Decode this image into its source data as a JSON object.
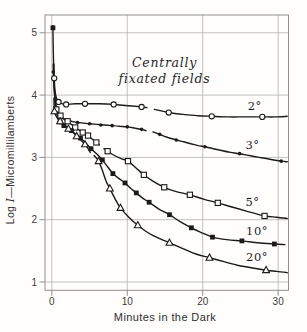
{
  "figure": {
    "kind": "scientific-line-chart",
    "background": "#fffefd"
  },
  "chart_data": {
    "type": "line",
    "title": "",
    "annotation": {
      "lines": [
        "Centrally",
        "fixated fields"
      ]
    },
    "x_axis": {
      "title": "Minutes in the Dark",
      "range": [
        -0.9,
        31.3
      ],
      "ticks": [
        {
          "value": 0,
          "label": "0"
        },
        {
          "value": 10,
          "label": "10"
        },
        {
          "value": 20,
          "label": "20"
        },
        {
          "value": 30,
          "label": "30"
        }
      ]
    },
    "y_axis": {
      "title_prefix": "Log ",
      "title_var": "I",
      "title_suffix": "—Micromillilamberts",
      "range": [
        0.87,
        5.29
      ],
      "ticks": [
        {
          "value": 5,
          "label": "5"
        },
        {
          "value": 4,
          "label": "4"
        },
        {
          "value": 3,
          "label": "3"
        },
        {
          "value": 2,
          "label": "2"
        },
        {
          "value": 1,
          "label": "1"
        }
      ]
    },
    "grid": true,
    "legend_position": "labels-on-curves",
    "colors": {
      "ink": "#1b1b1b",
      "grid": "#acacac",
      "frame": "#8f8f8f",
      "tick_text": "#3c3c3c",
      "background": "#ffffff"
    },
    "series": [
      {
        "name": "2°",
        "field_size_deg": 2,
        "marker": "open-circle",
        "label_pos": [
          26.9,
          3.83
        ],
        "points": [
          [
            0.32,
            4.27
          ],
          [
            0.9,
            3.89
          ],
          [
            1.9,
            3.85
          ],
          [
            4.4,
            3.86
          ],
          [
            8.2,
            3.85
          ],
          [
            11.9,
            3.81
          ],
          [
            15.5,
            3.72
          ],
          [
            21.2,
            3.66
          ],
          [
            27.9,
            3.65
          ]
        ],
        "line_segments": [
          [
            [
              0.28,
              4.5
            ],
            [
              0.32,
              4.27
            ],
            [
              0.45,
              4.05
            ],
            [
              0.62,
              3.95
            ],
            [
              0.9,
              3.89
            ],
            [
              1.4,
              3.86
            ],
            [
              1.9,
              3.85
            ],
            [
              3.1,
              3.86
            ],
            [
              4.4,
              3.86
            ],
            [
              6.3,
              3.86
            ],
            [
              8.2,
              3.85
            ],
            [
              10.1,
              3.83
            ],
            [
              11.9,
              3.81
            ],
            [
              12.6,
              3.8
            ]
          ],
          [
            [
              13.6,
              3.77
            ],
            [
              15.5,
              3.72
            ],
            [
              17.4,
              3.69
            ],
            [
              19.4,
              3.67
            ],
            [
              21.2,
              3.66
            ],
            [
              23.4,
              3.65
            ],
            [
              25.5,
              3.65
            ],
            [
              27.9,
              3.65
            ],
            [
              29.6,
              3.65
            ],
            [
              31.2,
              3.66
            ]
          ]
        ]
      },
      {
        "name": "3°",
        "field_size_deg": 3,
        "marker": "small-filled-circle",
        "label_pos": [
          26.6,
          3.2
        ],
        "points": [
          [
            0.2,
            4.37
          ],
          [
            0.65,
            3.79
          ],
          [
            1.3,
            3.64
          ],
          [
            1.9,
            3.6
          ],
          [
            3.4,
            3.56
          ],
          [
            5.0,
            3.54
          ],
          [
            6.5,
            3.52
          ],
          [
            8.0,
            3.51
          ],
          [
            10.0,
            3.49
          ],
          [
            11.9,
            3.45
          ],
          [
            14.3,
            3.37
          ],
          [
            16.5,
            3.28
          ],
          [
            20.3,
            3.17
          ],
          [
            24.9,
            3.06
          ],
          [
            30.4,
            2.94
          ]
        ],
        "line_segments": [
          [
            [
              0.18,
              4.5
            ],
            [
              0.2,
              4.37
            ],
            [
              0.3,
              4.1
            ],
            [
              0.45,
              3.92
            ],
            [
              0.65,
              3.79
            ],
            [
              0.95,
              3.7
            ],
            [
              1.3,
              3.64
            ],
            [
              1.9,
              3.6
            ],
            [
              2.6,
              3.58
            ],
            [
              3.4,
              3.56
            ],
            [
              4.2,
              3.55
            ],
            [
              5.0,
              3.54
            ],
            [
              6.0,
              3.53
            ],
            [
              7.0,
              3.52
            ],
            [
              8.0,
              3.51
            ],
            [
              9.0,
              3.5
            ],
            [
              10.0,
              3.49
            ],
            [
              11.0,
              3.47
            ],
            [
              11.9,
              3.45
            ],
            [
              12.5,
              3.43
            ]
          ],
          [
            [
              13.4,
              3.41
            ],
            [
              14.3,
              3.37
            ],
            [
              15.4,
              3.32
            ],
            [
              16.5,
              3.28
            ],
            [
              17.5,
              3.25
            ],
            [
              18.4,
              3.22
            ],
            [
              19.4,
              3.19
            ],
            [
              20.3,
              3.17
            ],
            [
              21.4,
              3.14
            ],
            [
              22.5,
              3.11
            ],
            [
              23.7,
              3.08
            ],
            [
              24.9,
              3.06
            ],
            [
              26.2,
              3.03
            ],
            [
              27.5,
              3.0
            ],
            [
              28.9,
              2.97
            ],
            [
              30.4,
              2.94
            ],
            [
              31.2,
              2.93
            ]
          ]
        ]
      },
      {
        "name": "5°",
        "field_size_deg": 5,
        "marker": "open-square",
        "label_pos": [
          26.6,
          2.28
        ],
        "points": [
          [
            0.6,
            3.77
          ],
          [
            1.15,
            3.67
          ],
          [
            2.1,
            3.58
          ],
          [
            3.1,
            3.48
          ],
          [
            4.1,
            3.4
          ],
          [
            4.8,
            3.35
          ],
          [
            5.9,
            3.24
          ],
          [
            7.4,
            3.1
          ],
          [
            10.1,
            2.94
          ],
          [
            12.2,
            2.72
          ],
          [
            14.9,
            2.52
          ],
          [
            18.3,
            2.4
          ],
          [
            22.0,
            2.27
          ],
          [
            28.2,
            2.06
          ]
        ],
        "line_segments": [
          [
            [
              0.38,
              4.0
            ],
            [
              0.45,
              3.86
            ],
            [
              0.6,
              3.77
            ],
            [
              0.85,
              3.71
            ],
            [
              1.15,
              3.67
            ],
            [
              1.5,
              3.63
            ],
            [
              2.1,
              3.58
            ],
            [
              2.6,
              3.53
            ],
            [
              3.1,
              3.48
            ],
            [
              3.6,
              3.44
            ],
            [
              4.1,
              3.4
            ],
            [
              4.8,
              3.35
            ],
            [
              5.3,
              3.3
            ],
            [
              5.9,
              3.24
            ],
            [
              6.3,
              3.2
            ]
          ],
          [
            [
              6.9,
              3.14
            ],
            [
              7.4,
              3.1
            ],
            [
              8.3,
              3.03
            ],
            [
              9.2,
              2.98
            ],
            [
              10.1,
              2.94
            ],
            [
              11.1,
              2.84
            ],
            [
              12.2,
              2.72
            ],
            [
              13.5,
              2.61
            ],
            [
              14.9,
              2.52
            ],
            [
              16.5,
              2.45
            ],
            [
              18.3,
              2.4
            ],
            [
              20.1,
              2.33
            ],
            [
              22.0,
              2.27
            ],
            [
              24.0,
              2.2
            ],
            [
              26.0,
              2.13
            ],
            [
              28.2,
              2.06
            ],
            [
              29.8,
              2.04
            ],
            [
              31.2,
              2.02
            ]
          ]
        ]
      },
      {
        "name": "10°",
        "field_size_deg": 10,
        "marker": "filled-square",
        "label_pos": [
          27.2,
          1.82
        ],
        "points": [
          [
            0.15,
            5.08
          ],
          [
            1.1,
            3.57
          ],
          [
            1.6,
            3.51
          ],
          [
            2.6,
            3.43
          ],
          [
            3.8,
            3.31
          ],
          [
            5.2,
            3.14
          ],
          [
            6.7,
            2.96
          ],
          [
            8.1,
            2.74
          ],
          [
            9.7,
            2.59
          ],
          [
            11.2,
            2.43
          ],
          [
            12.9,
            2.28
          ],
          [
            15.6,
            2.08
          ],
          [
            18.5,
            1.87
          ],
          [
            21.3,
            1.72
          ],
          [
            25.2,
            1.66
          ],
          [
            29.5,
            1.61
          ]
        ],
        "line_segments": [
          [
            [
              0.12,
              5.1
            ],
            [
              0.15,
              5.08
            ],
            [
              0.2,
              4.7
            ],
            [
              0.28,
              4.3
            ],
            [
              0.38,
              4.0
            ],
            [
              0.55,
              3.78
            ],
            [
              0.8,
              3.64
            ],
            [
              1.1,
              3.57
            ],
            [
              1.6,
              3.51
            ],
            [
              2.1,
              3.47
            ],
            [
              2.6,
              3.43
            ],
            [
              3.2,
              3.37
            ],
            [
              3.8,
              3.31
            ],
            [
              4.5,
              3.23
            ],
            [
              5.2,
              3.14
            ],
            [
              6.0,
              3.05
            ],
            [
              6.7,
              2.96
            ],
            [
              7.4,
              2.85
            ],
            [
              8.1,
              2.74
            ],
            [
              8.9,
              2.66
            ],
            [
              9.7,
              2.59
            ],
            [
              10.4,
              2.51
            ],
            [
              11.2,
              2.43
            ],
            [
              12.0,
              2.35
            ],
            [
              12.9,
              2.28
            ],
            [
              14.2,
              2.17
            ],
            [
              15.6,
              2.08
            ],
            [
              17.0,
              1.97
            ],
            [
              18.5,
              1.87
            ],
            [
              19.9,
              1.79
            ],
            [
              21.3,
              1.72
            ],
            [
              23.2,
              1.68
            ],
            [
              25.2,
              1.66
            ],
            [
              27.3,
              1.63
            ],
            [
              29.5,
              1.61
            ],
            [
              30.9,
              1.6
            ]
          ]
        ]
      },
      {
        "name": "20°",
        "field_size_deg": 20,
        "marker": "open-triangle",
        "label_pos": [
          27.2,
          1.4
        ],
        "points": [
          [
            0.35,
            3.74
          ],
          [
            1.1,
            3.58
          ],
          [
            2.2,
            3.46
          ],
          [
            3.3,
            3.34
          ],
          [
            4.4,
            3.21
          ],
          [
            6.2,
            2.94
          ],
          [
            7.7,
            2.5
          ],
          [
            9.1,
            2.19
          ],
          [
            11.4,
            1.91
          ],
          [
            15.6,
            1.63
          ],
          [
            20.9,
            1.39
          ],
          [
            28.4,
            1.19
          ]
        ],
        "line_segments": [
          [
            [
              0.28,
              3.95
            ],
            [
              0.35,
              3.74
            ],
            [
              0.55,
              3.67
            ],
            [
              0.8,
              3.62
            ],
            [
              1.1,
              3.58
            ],
            [
              1.6,
              3.53
            ],
            [
              2.2,
              3.46
            ],
            [
              2.8,
              3.4
            ],
            [
              3.3,
              3.34
            ],
            [
              3.9,
              3.27
            ],
            [
              4.4,
              3.21
            ],
            [
              4.8,
              3.14
            ],
            [
              5.1,
              3.08
            ]
          ],
          [
            [
              5.6,
              3.03
            ],
            [
              6.2,
              2.94
            ],
            [
              6.7,
              2.79
            ],
            [
              7.2,
              2.62
            ],
            [
              7.7,
              2.5
            ],
            [
              8.4,
              2.33
            ],
            [
              9.1,
              2.19
            ],
            [
              10.2,
              2.04
            ],
            [
              11.4,
              1.91
            ],
            [
              12.5,
              1.81
            ],
            [
              13.5,
              1.74
            ],
            [
              14.6,
              1.68
            ],
            [
              15.6,
              1.63
            ],
            [
              17.3,
              1.54
            ],
            [
              19.1,
              1.45
            ],
            [
              20.9,
              1.39
            ],
            [
              22.7,
              1.33
            ],
            [
              24.6,
              1.27
            ],
            [
              26.4,
              1.23
            ],
            [
              28.4,
              1.19
            ],
            [
              29.8,
              1.17
            ],
            [
              31.2,
              1.15
            ]
          ]
        ]
      }
    ]
  }
}
